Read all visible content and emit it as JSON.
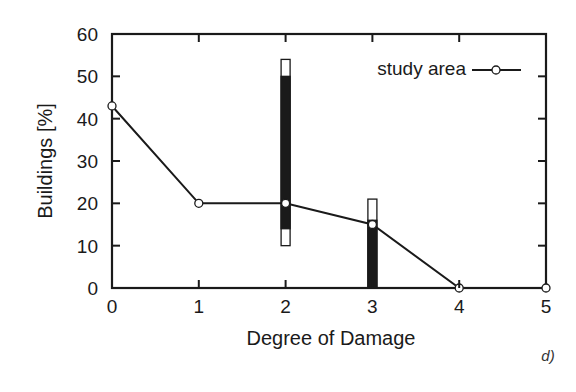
{
  "chart_data": {
    "type": "line",
    "title": "",
    "xlabel": "Degree of Damage",
    "ylabel": "Buildings [%]",
    "xlim": [
      0,
      5
    ],
    "ylim": [
      0,
      60
    ],
    "x_ticks": [
      0,
      1,
      2,
      3,
      4,
      5
    ],
    "y_ticks": [
      0,
      10,
      20,
      30,
      40,
      50,
      60
    ],
    "grid": false,
    "legend_position": "upper right",
    "series": [
      {
        "name": "study area",
        "marker": "open-circle",
        "x": [
          0,
          1,
          2,
          3,
          4,
          5
        ],
        "values": [
          43,
          20,
          20,
          15,
          0,
          0
        ]
      }
    ],
    "range_bars": [
      {
        "x": 2,
        "outer_range": [
          10,
          54
        ],
        "inner_range": [
          14,
          50
        ]
      },
      {
        "x": 3,
        "outer_range": [
          0,
          21
        ],
        "inner_range": [
          0,
          16
        ]
      }
    ],
    "annotations": [
      "d)"
    ]
  },
  "labels": {
    "xlabel": "Degree of Damage",
    "ylabel": "Buildings [%]",
    "legend": "study area",
    "panel": "d)"
  }
}
